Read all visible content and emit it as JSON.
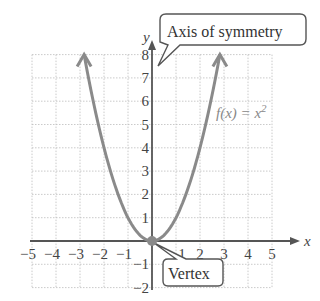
{
  "chart_data": {
    "type": "line",
    "title": "",
    "function_label": "f(x) = x²",
    "function_label_parts": {
      "f": "f(x) = x",
      "exp": "2"
    },
    "xlabel": "x",
    "ylabel": "y",
    "xlim": [
      -5,
      5
    ],
    "ylim": [
      -2,
      8
    ],
    "grid": true,
    "x_ticks": [
      "−5",
      "−4",
      "−3",
      "−2",
      "−1",
      "1",
      "2",
      "3",
      "4",
      "5"
    ],
    "y_ticks": [
      "−2",
      "−1",
      "1",
      "2",
      "3",
      "4",
      "5",
      "6",
      "7",
      "8"
    ],
    "series": [
      {
        "name": "f(x) = x²",
        "x": [
          -2.83,
          -2,
          -1,
          0,
          1,
          2,
          2.83
        ],
        "y": [
          8,
          4,
          1,
          0,
          1,
          4,
          8
        ]
      }
    ],
    "annotations": [
      {
        "text": "Axis of symmetry",
        "points_to": "x = 0 (y-axis)"
      },
      {
        "text": "Vertex",
        "points_to": [
          0,
          0
        ]
      }
    ],
    "colors": {
      "curve": "#8a8a8a",
      "axis": "#555555",
      "grid": "#bdbdbd",
      "vertex": "#8a8a8a"
    }
  }
}
